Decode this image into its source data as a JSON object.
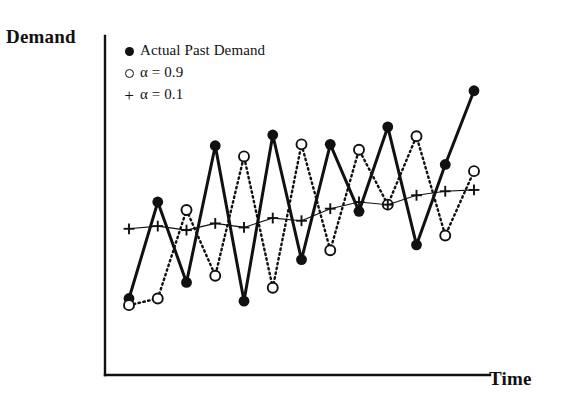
{
  "axes": {
    "ylabel": "Demand",
    "xlabel": "Time"
  },
  "legend": {
    "position": "top-left-inside",
    "items": [
      {
        "marker": "filled-circle",
        "label": "Actual Past Demand"
      },
      {
        "marker": "open-circle",
        "label": "α = 0.9"
      },
      {
        "marker": "plus",
        "label": "α = 0.1"
      }
    ]
  },
  "colors": {
    "ink": "#111111",
    "background": "#ffffff"
  },
  "chart_data": {
    "type": "line",
    "title": "",
    "subtitle": "",
    "xlabel": "Time",
    "ylabel": "Demand",
    "xlim": [
      0,
      14
    ],
    "ylim": [
      0,
      10
    ],
    "grid": false,
    "axis_ticks": false,
    "legend_position": "top-left-inside",
    "x": [
      1,
      2,
      3,
      4,
      5,
      6,
      7,
      8,
      9,
      10,
      11,
      12,
      13
    ],
    "series": [
      {
        "name": "Actual Past Demand",
        "marker": "filled-circle",
        "line_style": "solid",
        "line_width": "thick",
        "values": [
          1.55,
          5.15,
          2.15,
          7.25,
          1.45,
          7.65,
          3.0,
          7.3,
          4.8,
          7.95,
          3.55,
          6.55,
          9.3
        ]
      },
      {
        "name": "α = 0.9",
        "marker": "open-circle",
        "line_style": "dotted",
        "line_width": "medium",
        "values": [
          1.3,
          1.55,
          4.85,
          2.4,
          6.85,
          1.95,
          7.3,
          3.35,
          7.1,
          5.05,
          7.6,
          3.9,
          6.3
        ]
      },
      {
        "name": "α = 0.1",
        "marker": "plus",
        "line_style": "thin-solid",
        "line_width": "thin",
        "values": [
          4.15,
          4.25,
          4.1,
          4.35,
          4.2,
          4.55,
          4.45,
          4.9,
          5.15,
          5.05,
          5.4,
          5.55,
          5.6
        ]
      }
    ]
  }
}
